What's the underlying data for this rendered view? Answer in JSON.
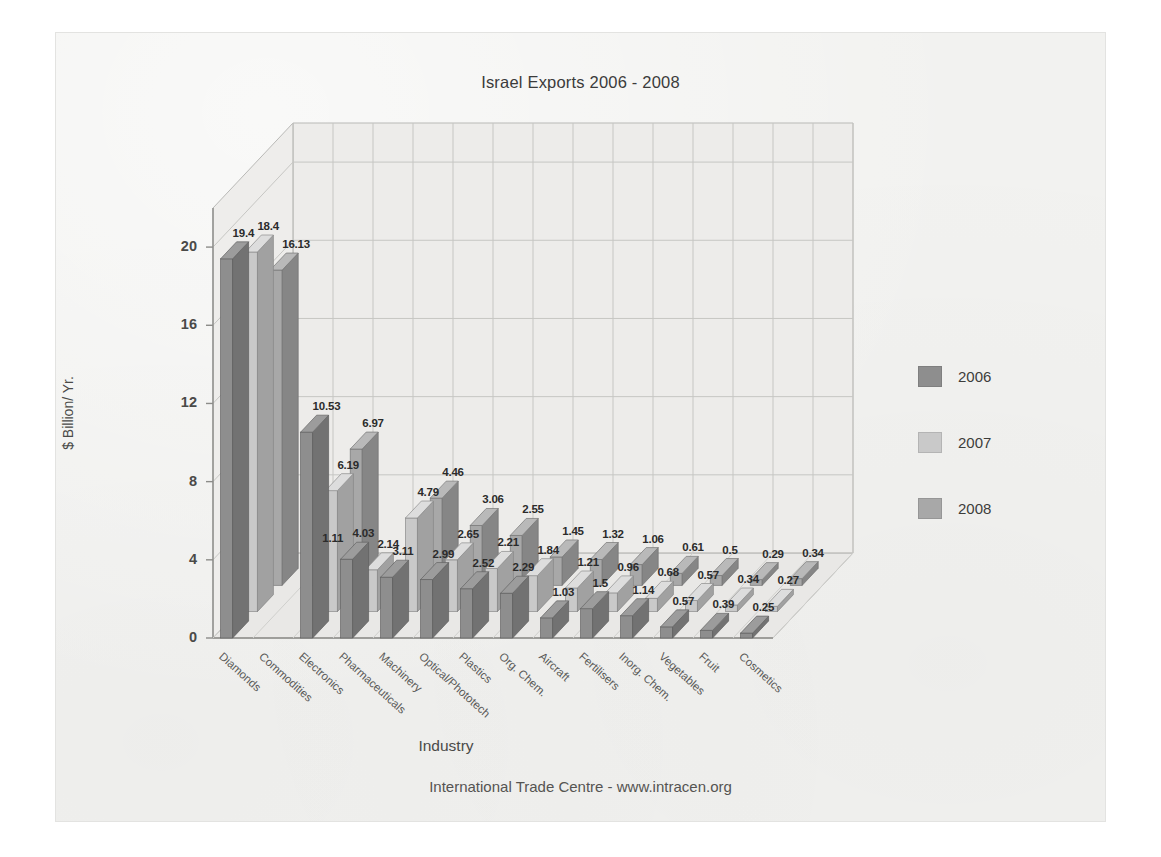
{
  "chart_data": {
    "type": "bar",
    "title": "Israel Exports  2006 - 2008",
    "subtitle": "",
    "xlabel": "Industry",
    "ylabel": "$ Billion/ Yr.",
    "ylim": [
      0,
      22
    ],
    "yticks": [
      "0",
      "4",
      "8",
      "12",
      "16",
      "20"
    ],
    "grid": true,
    "three_d": true,
    "legend_position": "right",
    "footer": "International Trade Centre -  www.intracen.org",
    "categories": [
      "Diamonds",
      "Commodities",
      "Electronics",
      "Pharmaceuticals",
      "Machinery",
      "Optical/Phototech",
      "Plastics",
      "Org. Chem.",
      "Aircraft",
      "Fertilisers",
      "Inorg. Chem.",
      "Vegetables",
      "Fruit",
      "Cosmetics"
    ],
    "series": [
      {
        "name": "2006",
        "color": "#8e8e8e",
        "values": [
          19.4,
          null,
          10.53,
          4.03,
          3.11,
          2.99,
          2.52,
          2.29,
          1.03,
          1.5,
          1.14,
          0.57,
          0.39,
          0.25
        ],
        "labels": [
          "19.4",
          "",
          "10.53",
          "4.03",
          "3.11",
          "2.99",
          "2.52",
          "2.29",
          "1.03",
          "1.5",
          "1.14",
          "0.57",
          "0.39",
          "0.25"
        ]
      },
      {
        "name": "2007",
        "color": "#c9c9c9",
        "values": [
          18.4,
          null,
          6.19,
          2.14,
          4.79,
          2.65,
          2.21,
          1.84,
          1.21,
          0.96,
          0.68,
          0.57,
          0.34,
          0.27
        ],
        "labels": [
          "18.4",
          "",
          "6.19",
          "2.14",
          "4.79",
          "2.65",
          "2.21",
          "1.84",
          "1.21",
          "0.96",
          "0.68",
          "0.57",
          "0.34",
          "0.27"
        ]
      },
      {
        "name": "2008",
        "color": "#a8a8a8",
        "values": [
          16.13,
          1.11,
          6.97,
          null,
          4.46,
          3.06,
          2.55,
          1.45,
          1.32,
          1.06,
          0.61,
          0.5,
          0.29,
          0.34
        ],
        "labels": [
          "16.13",
          "1.11",
          "6.97",
          "",
          "4.46",
          "3.06",
          "2.55",
          "1.45",
          "1.32",
          "1.06",
          "0.61",
          "0.5",
          "0.29",
          "0.34"
        ]
      }
    ]
  },
  "legend": {
    "items": [
      {
        "label": "2006",
        "color": "#8e8e8e"
      },
      {
        "label": "2007",
        "color": "#c9c9c9"
      },
      {
        "label": "2008",
        "color": "#a8a8a8"
      }
    ]
  }
}
